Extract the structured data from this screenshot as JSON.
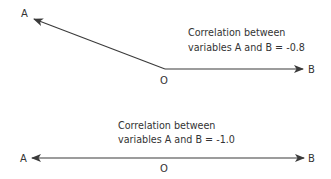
{
  "diagram": {
    "type": "vector-correlation",
    "colors": {
      "line": "#3a3a3a",
      "text": "#333333",
      "background": "#ffffff"
    },
    "panels": [
      {
        "id": "top",
        "vector_a_label": "A",
        "vector_b_label": "B",
        "origin_label": "O",
        "caption_line1": "Correlation between",
        "caption_line2": "variables A and B = -0.8",
        "correlation": -0.8
      },
      {
        "id": "bottom",
        "vector_a_label": "A",
        "vector_b_label": "B",
        "origin_label": "O",
        "caption_line1": "Correlation between",
        "caption_line2": "variables A and B = -1.0",
        "correlation": -1.0
      }
    ]
  }
}
